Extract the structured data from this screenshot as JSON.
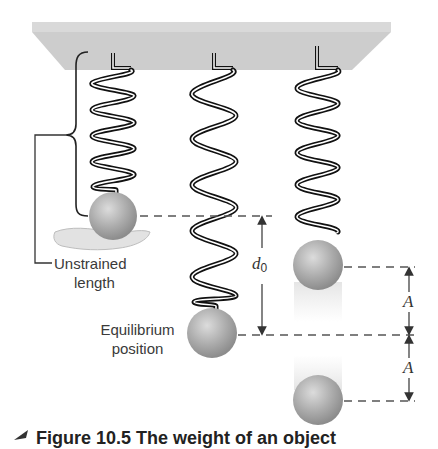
{
  "labels": {
    "unstrained_line1": "Unstrained",
    "unstrained_line2": "length",
    "equilibrium_line1": "Equilibrium",
    "equilibrium_line2": "position",
    "d0_symbol": "d",
    "d0_subscript": "0",
    "amplitude_upper": "A",
    "amplitude_lower": "A"
  },
  "caption": {
    "text": "Figure 10.5  The weight of an object"
  },
  "colors": {
    "ceiling": "#cfcfcf",
    "ceiling_top": "#dadada",
    "spring_dark": "#111111",
    "spring_light": "#ffffff",
    "ball": "#a9a9a9",
    "ball_highlight": "#d6d6d6",
    "dash": "#555555",
    "text": "#3a3a3a"
  }
}
